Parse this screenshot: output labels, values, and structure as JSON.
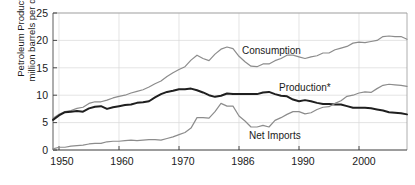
{
  "chart_data": {
    "type": "line",
    "title": "",
    "xlabel": "",
    "ylabel": "Petroleum Products million barrels per day",
    "ylabel_line1": "Petroleum Products",
    "ylabel_line2": "million barrels per day",
    "xlim": [
      1949,
      2008
    ],
    "ylim": [
      0,
      25
    ],
    "ytick_labels": [
      "25",
      "20",
      "15",
      "10",
      "5",
      "0"
    ],
    "ytick_values": [
      25,
      20,
      15,
      10,
      5,
      0
    ],
    "xtick_labels": [
      "1950",
      "1960",
      "1970",
      "1986",
      "1990",
      "2000"
    ],
    "xtick_values": [
      1950,
      1960,
      1970,
      1980,
      1990,
      2000
    ],
    "grid": "both-light",
    "legend_position": "inline-annotations",
    "x": [
      1949,
      1950,
      1951,
      1952,
      1953,
      1954,
      1955,
      1956,
      1957,
      1958,
      1959,
      1960,
      1961,
      1962,
      1963,
      1964,
      1965,
      1966,
      1967,
      1968,
      1969,
      1970,
      1971,
      1972,
      1973,
      1974,
      1975,
      1976,
      1977,
      1978,
      1979,
      1980,
      1981,
      1982,
      1983,
      1984,
      1985,
      1986,
      1987,
      1988,
      1989,
      1990,
      1991,
      1992,
      1993,
      1994,
      1995,
      1996,
      1997,
      1998,
      1999,
      2000,
      2001,
      2002,
      2003,
      2004,
      2005,
      2006,
      2007,
      2008
    ],
    "series": [
      {
        "name": "Consumption",
        "color": "#8c8c8c",
        "width": 1.2,
        "label": "Consumption",
        "label_x": 1981.5,
        "label_y": 18.0,
        "values": [
          5.8,
          6.5,
          7.0,
          7.2,
          7.6,
          7.8,
          8.5,
          8.8,
          8.8,
          9.1,
          9.5,
          9.8,
          10.0,
          10.4,
          10.7,
          11.0,
          11.5,
          12.1,
          12.6,
          13.4,
          14.1,
          14.7,
          15.2,
          16.4,
          17.3,
          16.7,
          16.3,
          17.5,
          18.4,
          18.8,
          18.5,
          17.1,
          16.1,
          15.3,
          15.2,
          15.7,
          15.7,
          16.3,
          16.7,
          17.3,
          17.3,
          17.0,
          16.7,
          17.0,
          17.2,
          17.7,
          17.7,
          18.3,
          18.6,
          18.9,
          19.5,
          19.7,
          19.6,
          19.8,
          20.0,
          20.7,
          20.8,
          20.7,
          20.7,
          20.2
        ]
      },
      {
        "name": "Production",
        "color": "#1f1f1f",
        "width": 2.0,
        "label": "Production*",
        "label_x": 1988.0,
        "label_y": 11.3,
        "values": [
          5.5,
          6.3,
          6.9,
          7.0,
          7.1,
          7.0,
          7.6,
          7.9,
          8.0,
          7.5,
          7.8,
          8.0,
          8.2,
          8.3,
          8.6,
          8.7,
          8.9,
          9.6,
          10.2,
          10.6,
          10.8,
          11.1,
          11.1,
          11.2,
          10.9,
          10.5,
          10.0,
          9.7,
          9.9,
          10.3,
          10.2,
          10.2,
          10.2,
          10.2,
          10.2,
          10.5,
          10.6,
          10.2,
          9.9,
          9.8,
          9.2,
          8.9,
          9.1,
          8.9,
          8.6,
          8.4,
          8.4,
          8.3,
          8.3,
          8.0,
          7.7,
          7.7,
          7.7,
          7.6,
          7.4,
          7.2,
          6.9,
          6.8,
          6.7,
          6.5
        ]
      },
      {
        "name": "Net Imports",
        "color": "#8c8c8c",
        "width": 1.2,
        "label": "Net Imports",
        "label_x": 1984.0,
        "label_y": 2.6,
        "values": [
          0.2,
          0.5,
          0.5,
          0.7,
          0.8,
          0.9,
          1.1,
          1.2,
          1.2,
          1.5,
          1.6,
          1.6,
          1.7,
          1.8,
          1.7,
          1.8,
          1.9,
          1.9,
          1.8,
          2.1,
          2.4,
          2.8,
          3.2,
          4.0,
          5.9,
          5.9,
          5.8,
          7.0,
          8.5,
          8.0,
          8.0,
          6.2,
          5.3,
          4.2,
          4.2,
          4.5,
          4.2,
          5.4,
          5.9,
          6.5,
          7.0,
          7.0,
          6.6,
          6.8,
          7.4,
          7.8,
          7.9,
          8.5,
          9.0,
          9.8,
          10.0,
          10.4,
          10.6,
          10.5,
          11.2,
          11.8,
          12.0,
          11.9,
          11.8,
          11.6
        ]
      }
    ],
    "footnote_marker": "*"
  },
  "axes": {
    "plot_left_px": 53,
    "plot_right_px": 407,
    "plot_top_px": 13,
    "plot_bottom_px": 150
  }
}
